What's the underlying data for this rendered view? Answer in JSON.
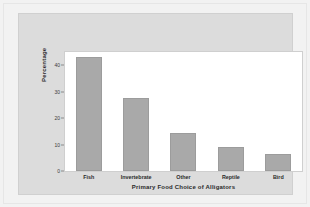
{
  "figure": {
    "panel_color": "#dcdcdc",
    "plot_background": "#ffffff",
    "bar_color": "#a9a9a9",
    "axis_text_color": "#2a2a2a"
  },
  "chart_data": {
    "type": "bar",
    "title": "",
    "xlabel": "Primary Food Choice of Alligators",
    "ylabel": "Percentage",
    "categories": [
      "Fish",
      "Invertebrate",
      "Other",
      "Reptile",
      "Bird"
    ],
    "values": [
      43,
      27.5,
      14.5,
      9,
      6.5
    ],
    "ylim": [
      0,
      45
    ],
    "yticks": [
      0,
      10,
      20,
      30,
      40
    ],
    "ytick_labels": [
      "0",
      "10",
      "20",
      "30",
      "40"
    ],
    "grid": false,
    "legend": null,
    "series": [
      {
        "name": "Percentage",
        "values": [
          43,
          27.5,
          14.5,
          9,
          6.5
        ]
      }
    ]
  }
}
